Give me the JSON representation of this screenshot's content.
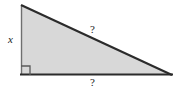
{
  "figure": {
    "type": "right-triangle-geometry-diagram",
    "background_color": "#ffffff",
    "fill_color": "#d8d8d8",
    "stroke_color": "#2b2b2b",
    "left_leg_stroke_color": "#6f6f6f",
    "label_color": "#1a1a1a",
    "vertices": {
      "apex": {
        "x": 21,
        "y": 5
      },
      "right_angle_corner": {
        "x": 21,
        "y": 75
      },
      "base_right": {
        "x": 172,
        "y": 75
      }
    },
    "right_angle_marker": {
      "name": "right-angle-square",
      "size": 9,
      "x": 21,
      "y": 75
    },
    "labels": {
      "vertical_leg": "x",
      "hypotenuse": "?",
      "base": "?"
    }
  }
}
